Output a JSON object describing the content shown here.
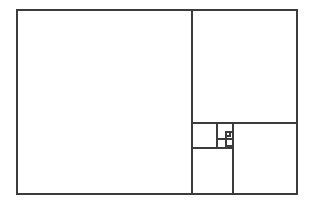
{
  "figure": {
    "background_color": "#ffffff",
    "line_color": "#3c3c3c",
    "line_width": 1.6,
    "canvas": {
      "width": 315,
      "height": 203
    },
    "outer_rect": {
      "x": 17,
      "y": 10,
      "width": 280,
      "height": 184
    },
    "squares": [
      {
        "name": "square-1-large-left",
        "x": 17,
        "y": 10,
        "width": 175,
        "height": 184
      },
      {
        "name": "square-2-upper-right",
        "x": 192,
        "y": 10,
        "width": 105,
        "height": 113
      },
      {
        "name": "square-3-lower-right",
        "x": 233,
        "y": 123,
        "width": 64,
        "height": 71
      },
      {
        "name": "square-4-lower-mid",
        "x": 192,
        "y": 148,
        "width": 41,
        "height": 46
      },
      {
        "name": "square-5-mid",
        "x": 192,
        "y": 123,
        "width": 25,
        "height": 25
      },
      {
        "name": "square-6-small",
        "x": 217,
        "y": 123,
        "width": 16,
        "height": 16
      },
      {
        "name": "square-7-tiny",
        "x": 217,
        "y": 139,
        "width": 9,
        "height": 9
      },
      {
        "name": "square-8-micro",
        "x": 226,
        "y": 139,
        "width": 7,
        "height": 7
      },
      {
        "name": "square-9-nano",
        "x": 226,
        "y": 132,
        "width": 4,
        "height": 4
      }
    ],
    "dividers": [
      {
        "name": "divider-main-vertical",
        "x1": 192,
        "y1": 10,
        "x2": 192,
        "y2": 194
      },
      {
        "name": "divider-right-horizontal",
        "x1": 192,
        "y1": 123,
        "x2": 297,
        "y2": 123
      },
      {
        "name": "divider-lower-vertical",
        "x1": 233,
        "y1": 123,
        "x2": 233,
        "y2": 194
      },
      {
        "name": "divider-mid-horizontal",
        "x1": 192,
        "y1": 148,
        "x2": 233,
        "y2": 148
      },
      {
        "name": "divider-mid-vertical",
        "x1": 217,
        "y1": 123,
        "x2": 217,
        "y2": 148
      },
      {
        "name": "divider-small-horizontal",
        "x1": 217,
        "y1": 139,
        "x2": 233,
        "y2": 139
      },
      {
        "name": "divider-tiny-vertical",
        "x1": 226,
        "y1": 132,
        "x2": 226,
        "y2": 148
      },
      {
        "name": "divider-nano-horizontal",
        "x1": 226,
        "y1": 132,
        "x2": 233,
        "y2": 132
      }
    ]
  }
}
